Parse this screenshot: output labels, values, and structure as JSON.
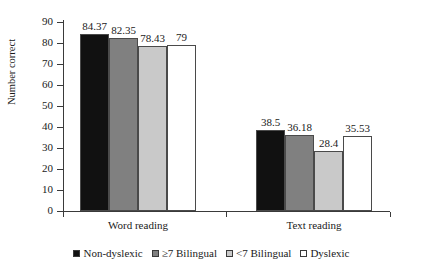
{
  "chart_data": {
    "type": "bar",
    "title": "",
    "xlabel": "",
    "ylabel": "Number correct",
    "ylim": [
      0,
      90
    ],
    "yticks": [
      0,
      10,
      20,
      30,
      40,
      50,
      60,
      70,
      80,
      90
    ],
    "grid": false,
    "legend_position": "bottom",
    "categories": [
      "Word reading",
      "Text reading"
    ],
    "series": [
      {
        "name": "Non-dyslexic",
        "color": "#111111",
        "values": [
          84.37,
          38.5
        ]
      },
      {
        "name": "≥7 Bilingual",
        "color": "#808080",
        "values": [
          82.35,
          36.18
        ]
      },
      {
        "name": "<7 Bilingual",
        "color": "#c9c9c9",
        "values": [
          78.43,
          28.4
        ]
      },
      {
        "name": "Dyslexic",
        "color": "#ffffff",
        "values": [
          79,
          35.53
        ]
      }
    ],
    "value_labels": [
      [
        "84.37",
        "82.35",
        "78.43",
        "79"
      ],
      [
        "38.5",
        "36.18",
        "28.4",
        "35.53"
      ]
    ],
    "ytick_labels": [
      "0",
      "10",
      "20",
      "30",
      "40",
      "50",
      "60",
      "70",
      "80",
      "90"
    ]
  }
}
